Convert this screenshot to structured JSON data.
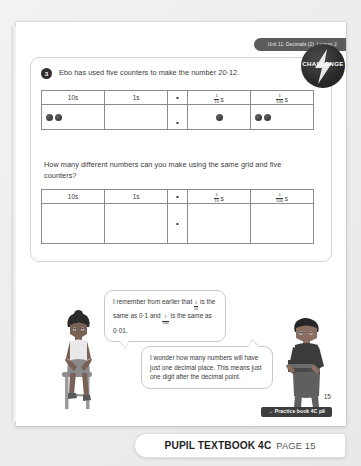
{
  "header": {
    "unit_label": "Unit 11: Decimals (2), Lesson 2"
  },
  "challenge": {
    "label": "CHALLENGE",
    "icon": "lightning-bolt-icon"
  },
  "question": {
    "number": "3",
    "text": "Ebo has used five counters to make the number 20·12."
  },
  "prompt": {
    "text": "How many different numbers can you make using the same grid and five counters?"
  },
  "table": {
    "headers": {
      "tens": "10s",
      "ones": "1s",
      "point": "•",
      "tenths_num": "1",
      "tenths_den": "10",
      "tenths_suffix": "s",
      "hundredths_num": "1",
      "hundredths_den": "100",
      "hundredths_suffix": "s"
    },
    "filled_row": {
      "tens_counters": 2,
      "ones_counters": 0,
      "point": "•",
      "tenths_counters": 1,
      "hundredths_counters": 2
    },
    "empty_row": {
      "tens_counters": 0,
      "ones_counters": 0,
      "point": "•",
      "tenths_counters": 0,
      "hundredths_counters": 0
    }
  },
  "bubbles": [
    {
      "speaker": "girl",
      "part1": "I remember from earlier that",
      "frac1_num": "1",
      "frac1_den": "10",
      "part2": "is the same as 0·1 and",
      "frac2_num": "1",
      "frac2_den": "100",
      "part3": "is the same as 0·01."
    },
    {
      "speaker": "boy",
      "text": "I wonder how many numbers will have just one decimal place. This means just one digit after the decimal point."
    }
  ],
  "footer": {
    "page_number": "15",
    "practice_link": "→ Practice book 4C p9",
    "title": "PUPIL TEXTBOOK 4C",
    "page_label": "PAGE 15"
  },
  "colors": {
    "badge_dark": "#2a2a2a",
    "header_tab": "#5c5c5c",
    "page_background": "#ffffff",
    "canvas_background": "#efefef",
    "counter": "#3d3d3d"
  }
}
